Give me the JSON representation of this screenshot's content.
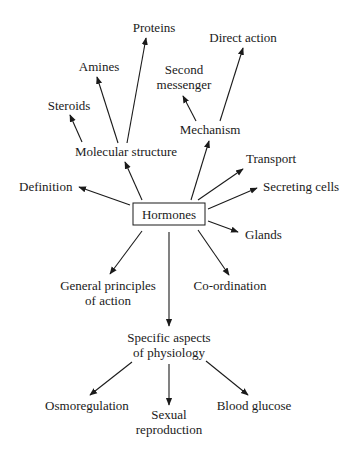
{
  "center": {
    "label": "Hormones"
  },
  "nodes": {
    "proteins": "Proteins",
    "amines": "Amines",
    "steroids": "Steroids",
    "molecular_structure": "Molecular structure",
    "direct_action": "Direct action",
    "second_messenger_1": "Second",
    "second_messenger_2": "messenger",
    "mechanism": "Mechanism",
    "transport": "Transport",
    "secreting_cells": "Secreting cells",
    "definition": "Definition",
    "glands": "Glands",
    "general_principles_1": "General principles",
    "general_principles_2": "of action",
    "coordination": "Co-ordination",
    "specific_aspects_1": "Specific aspects",
    "specific_aspects_2": "of physiology",
    "osmoregulation": "Osmoregulation",
    "sexual_reproduction_1": "Sexual",
    "sexual_reproduction_2": "reproduction",
    "blood_glucose": "Blood glucose"
  }
}
